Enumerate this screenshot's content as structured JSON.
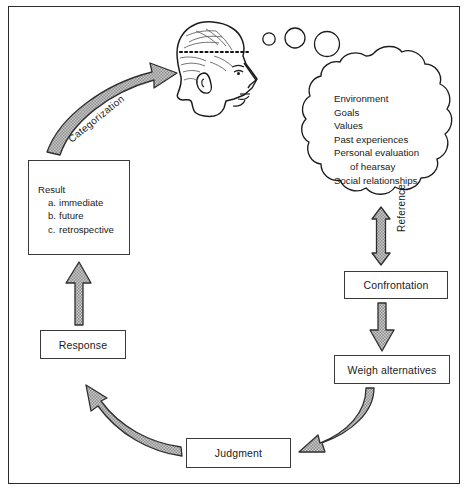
{
  "diagram": {
    "border_color": "#2b2b2b",
    "arrow_fill": "#b4b4b4",
    "arrow_stroke": "#2f2f2f"
  },
  "head": {
    "name": "human-head-profile",
    "description": "side profile of a human head facing right with dotted line across forehead",
    "thought_bubbles": 3
  },
  "cloud": {
    "name": "thought-cloud",
    "lines": [
      "Environment",
      "Goals",
      "Values",
      "Past experiences",
      "Personal evaluation",
      "of hearsay",
      "Social relationships"
    ],
    "indented_lines": [
      5
    ]
  },
  "result_box": {
    "title": "Result",
    "items": [
      {
        "marker": "a.",
        "label": "immediate"
      },
      {
        "marker": "b.",
        "label": "future"
      },
      {
        "marker": "c.",
        "label": "retrospective"
      }
    ]
  },
  "nodes": {
    "confrontation": "Confrontation",
    "weigh_alternatives": "Weigh alternatives",
    "judgment": "Judgment",
    "response": "Response"
  },
  "arrow_labels": {
    "reference": "Reference",
    "categorization": "Categorization"
  }
}
